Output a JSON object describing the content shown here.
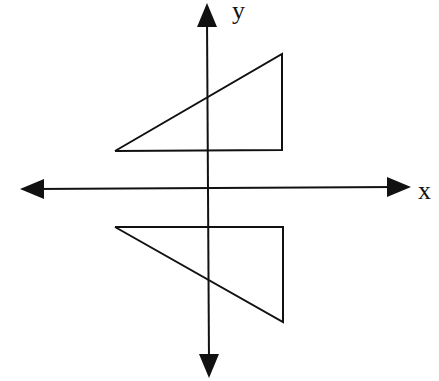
{
  "diagram": {
    "type": "coordinate-plane-reflection",
    "colors": {
      "stroke": "#111111",
      "background": "#ffffff"
    },
    "axes": {
      "x": {
        "label": "x",
        "from": [
          20,
          189
        ],
        "to": [
          411,
          187
        ]
      },
      "y": {
        "label": "y",
        "from": [
          209,
          378
        ],
        "to": [
          207,
          3
        ]
      }
    },
    "shapes": [
      {
        "name": "upper-triangle",
        "points": [
          [
            115,
            151
          ],
          [
            282,
            54
          ],
          [
            282,
            150
          ],
          [
            115,
            151
          ]
        ]
      },
      {
        "name": "lower-triangle",
        "points": [
          [
            115,
            227
          ],
          [
            283,
            227
          ],
          [
            283,
            322
          ],
          [
            115,
            227
          ]
        ]
      }
    ]
  }
}
